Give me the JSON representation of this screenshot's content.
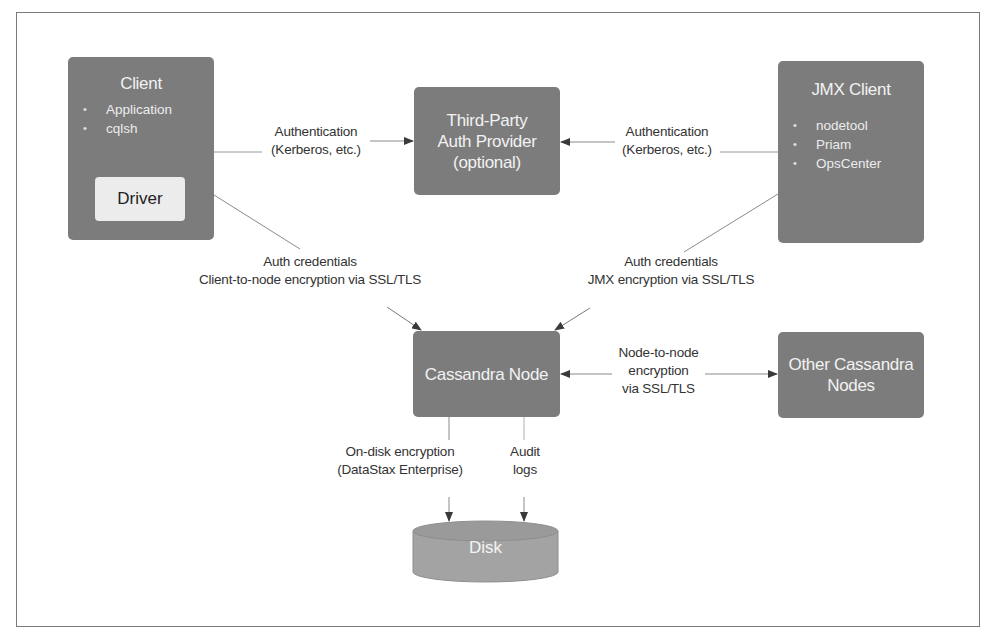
{
  "diagram": {
    "title": "",
    "nodes": {
      "client": {
        "title": "Client",
        "items": [
          "Application",
          "cqlsh"
        ],
        "driver_label": "Driver"
      },
      "auth_provider": {
        "lines": [
          "Third-Party",
          "Auth Provider",
          "(optional)"
        ]
      },
      "jmx_client": {
        "title": "JMX Client",
        "items": [
          "nodetool",
          "Priam",
          "OpsCenter"
        ]
      },
      "cassandra_node": {
        "title": "Cassandra Node"
      },
      "other_nodes": {
        "lines": [
          "Other Cassandra",
          "Nodes"
        ]
      },
      "disk": {
        "title": "Disk"
      }
    },
    "edges": {
      "client_auth": {
        "lines": [
          "Authentication",
          "(Kerberos, etc.)"
        ]
      },
      "jmx_auth": {
        "lines": [
          "Authentication",
          "(Kerberos, etc.)"
        ]
      },
      "client_node": {
        "lines": [
          "Auth credentials",
          "Client-to-node encryption via SSL/TLS"
        ]
      },
      "jmx_node": {
        "lines": [
          "Auth credentials",
          "JMX encryption via SSL/TLS"
        ]
      },
      "node_to_node": {
        "lines": [
          "Node-to-node",
          "encryption",
          "via SSL/TLS"
        ]
      },
      "on_disk": {
        "lines": [
          "On-disk encryption",
          "(DataStax Enterprise)"
        ]
      },
      "audit": {
        "lines": [
          "Audit",
          "logs"
        ]
      }
    },
    "colors": {
      "box_fill": "#7c7c7c",
      "box_text": "#f2f2f2",
      "driver_fill": "#ececec",
      "disk_fill": "#a3a3a3",
      "line": "#8a8a8a",
      "arrow": "#3a3a3a",
      "label_text": "#333333"
    }
  }
}
